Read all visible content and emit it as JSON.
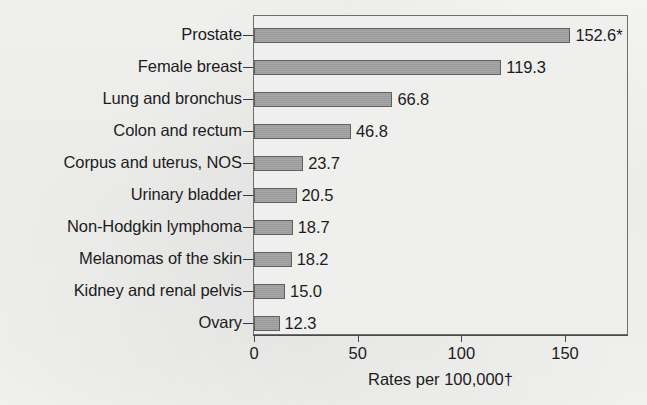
{
  "chart_data": {
    "type": "bar",
    "orientation": "horizontal",
    "title": "",
    "xlabel": "Rates per 100,000†",
    "ylabel": "",
    "categories": [
      "Prostate",
      "Female breast",
      "Lung and bronchus",
      "Colon and rectum",
      "Corpus and uterus, NOS",
      "Urinary bladder",
      "Non-Hodgkin lymphoma",
      "Melanomas of the skin",
      "Kidney and renal pelvis",
      "Ovary"
    ],
    "values": [
      152.6,
      119.3,
      66.8,
      46.8,
      23.7,
      20.5,
      18.7,
      18.2,
      15.0,
      12.3
    ],
    "value_labels": [
      "152.6*",
      "119.3",
      "66.8",
      "46.8",
      "23.7",
      "20.5",
      "18.7",
      "18.2",
      "15.0",
      "12.3"
    ],
    "xticks": [
      0,
      50,
      100,
      150
    ],
    "xtick_labels": [
      "0",
      "50",
      "100",
      "150"
    ],
    "xlim": [
      0,
      180
    ],
    "grid": false,
    "legend": "none",
    "bar_color": "#a0a0a0",
    "bar_border_color": "#5f5f5f",
    "plot_background": "#efefee",
    "page_background": "#f3f3f2",
    "text_color": "#1c1c1c",
    "footnote_markers": [
      "*",
      "†"
    ]
  }
}
